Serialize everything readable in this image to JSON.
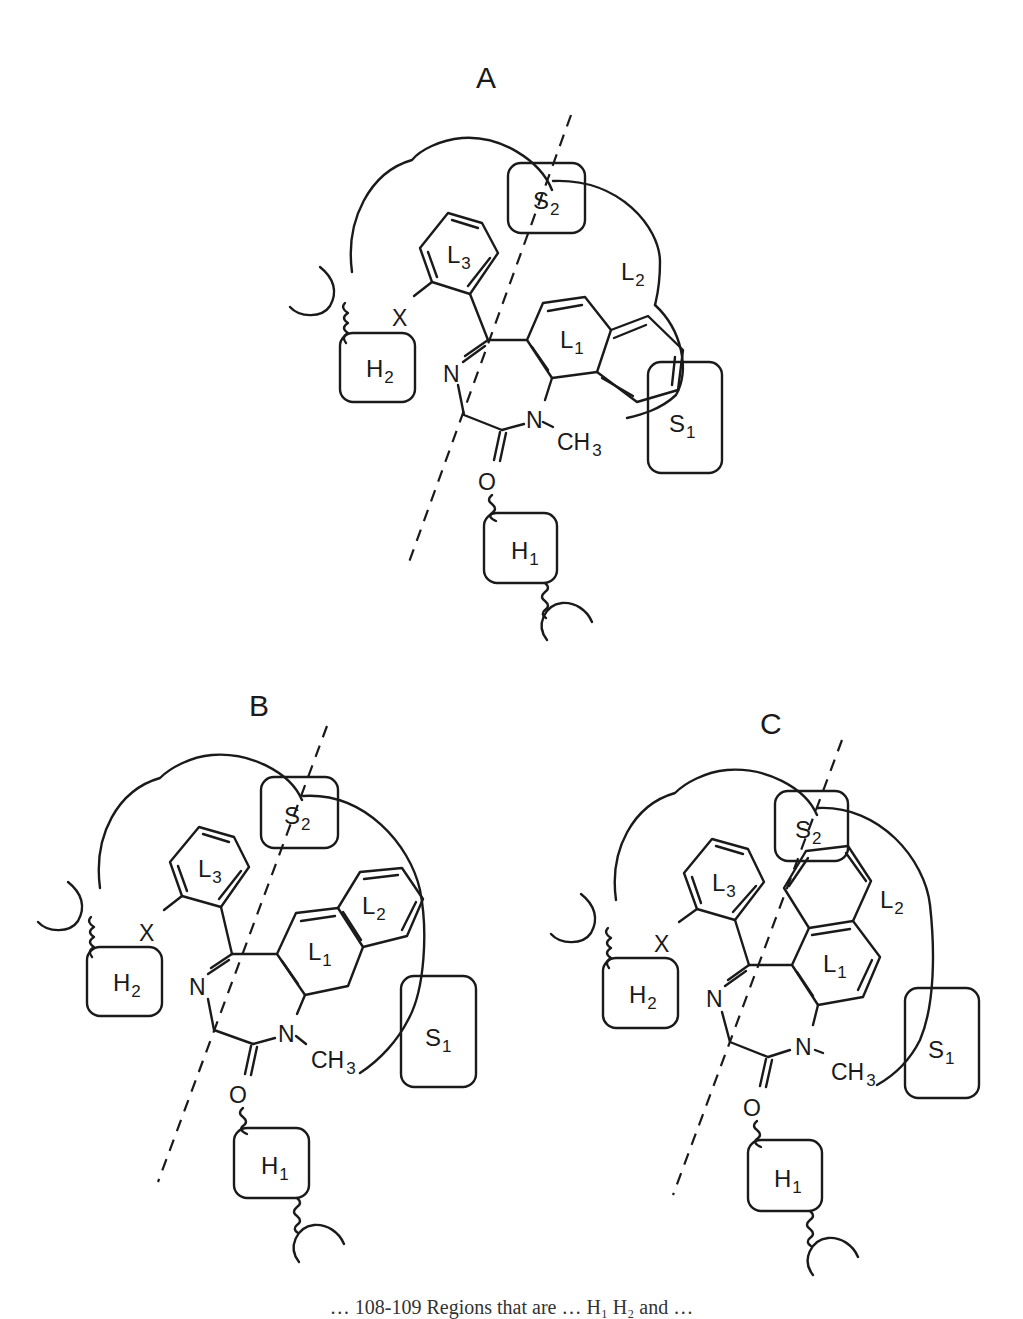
{
  "figure": {
    "panels": [
      {
        "id": "A",
        "title": "A",
        "regions": {
          "S2": {
            "main": "S",
            "sub": "2"
          },
          "S1": {
            "main": "S",
            "sub": "1"
          },
          "H1": {
            "main": "H",
            "sub": "1"
          },
          "H2": {
            "main": "H",
            "sub": "2"
          },
          "L1": {
            "main": "L",
            "sub": "1"
          },
          "L2": {
            "main": "L",
            "sub": "2"
          },
          "L3": {
            "main": "L",
            "sub": "3"
          }
        },
        "atoms": {
          "N_imine": "N",
          "N_amide": "N",
          "methyl": "CH",
          "methyl_sub": "3",
          "oxygen": "O",
          "substituent": "X"
        }
      },
      {
        "id": "B",
        "title": "B",
        "regions": {
          "S2": {
            "main": "S",
            "sub": "2"
          },
          "S1": {
            "main": "S",
            "sub": "1"
          },
          "H1": {
            "main": "H",
            "sub": "1"
          },
          "H2": {
            "main": "H",
            "sub": "2"
          },
          "L1": {
            "main": "L",
            "sub": "1"
          },
          "L2": {
            "main": "L",
            "sub": "2"
          },
          "L3": {
            "main": "L",
            "sub": "3"
          }
        },
        "atoms": {
          "N_imine": "N",
          "N_amide": "N",
          "methyl": "CH",
          "methyl_sub": "3",
          "oxygen": "O",
          "substituent": "X"
        }
      },
      {
        "id": "C",
        "title": "C",
        "regions": {
          "S2": {
            "main": "S",
            "sub": "2"
          },
          "S1": {
            "main": "S",
            "sub": "1"
          },
          "H1": {
            "main": "H",
            "sub": "1"
          },
          "H2": {
            "main": "H",
            "sub": "2"
          },
          "L1": {
            "main": "L",
            "sub": "1"
          },
          "L2": {
            "main": "L",
            "sub": "2"
          },
          "L3": {
            "main": "L",
            "sub": "3"
          }
        },
        "atoms": {
          "N_imine": "N",
          "N_amide": "N",
          "methyl": "CH",
          "methyl_sub": "3",
          "oxygen": "O",
          "substituent": "X"
        }
      }
    ],
    "caption_partial": "… 108-109 Regions that are … H₁ H₂ and …"
  }
}
